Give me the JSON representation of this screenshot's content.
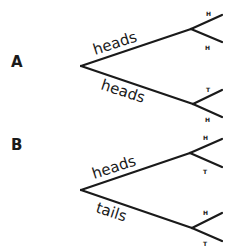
{
  "diagrams": [
    {
      "label": "A",
      "upper_branch": "heads",
      "lower_branch": "heads",
      "upper_leaves": [
        "H",
        "H"
      ],
      "lower_leaves": [
        "T",
        "H"
      ]
    },
    {
      "label": "B",
      "upper_branch": "heads",
      "lower_branch": "tails",
      "upper_leaves": [
        "H",
        "T"
      ],
      "lower_leaves": [
        "H",
        "T"
      ]
    }
  ],
  "colors": {
    "ink": "#1a1a1a",
    "background": "#ffffff"
  }
}
